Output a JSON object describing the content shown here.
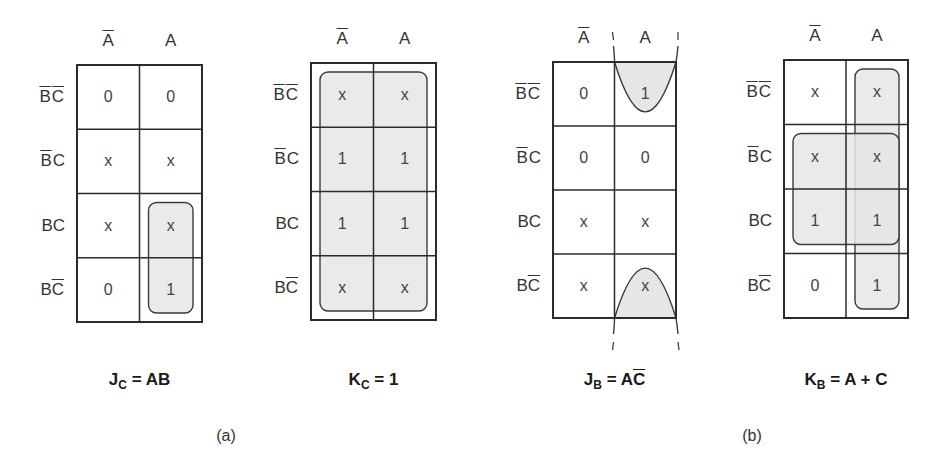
{
  "figure": {
    "panels": [
      {
        "id": "a",
        "label": "(a)",
        "x": 226,
        "y": 427
      },
      {
        "id": "b",
        "label": "(b)",
        "x": 752,
        "y": 427
      }
    ],
    "row_headers": [
      {
        "parts": [
          {
            "t": "B",
            "bar": true
          },
          {
            "t": "C",
            "bar": true
          }
        ]
      },
      {
        "parts": [
          {
            "t": "B",
            "bar": true
          },
          {
            "t": "C",
            "bar": false
          }
        ]
      },
      {
        "parts": [
          {
            "t": "B",
            "bar": false
          },
          {
            "t": "C",
            "bar": false
          }
        ]
      },
      {
        "parts": [
          {
            "t": "B",
            "bar": false
          },
          {
            "t": "C",
            "bar": true
          }
        ]
      }
    ],
    "col_headers": [
      {
        "t": "A",
        "bar": true
      },
      {
        "t": "A",
        "bar": false
      }
    ],
    "maps": [
      {
        "name": "kmap-jc",
        "x0": 77,
        "x1": 202,
        "y0": 65,
        "y1": 322,
        "cells": [
          [
            "0",
            "0"
          ],
          [
            "x",
            "x"
          ],
          [
            "x",
            "x"
          ],
          [
            "0",
            "1"
          ]
        ],
        "equation": {
          "lhs": "J",
          "sub": "C",
          "rhs": [
            {
              "t": "AB",
              "bar": false
            }
          ]
        },
        "eq_y": 370
      },
      {
        "name": "kmap-kc",
        "x0": 311,
        "x1": 436,
        "y0": 63,
        "y1": 320,
        "cells": [
          [
            "x",
            "x"
          ],
          [
            "1",
            "1"
          ],
          [
            "1",
            "1"
          ],
          [
            "x",
            "x"
          ]
        ],
        "equation": {
          "lhs": "K",
          "sub": "C",
          "rhs": [
            {
              "t": "1",
              "bar": false
            }
          ]
        },
        "eq_y": 370
      },
      {
        "name": "kmap-jb",
        "x0": 553,
        "x1": 676,
        "y0": 62,
        "y1": 318,
        "cells": [
          [
            "0",
            "1"
          ],
          [
            "0",
            "0"
          ],
          [
            "x",
            "x"
          ],
          [
            "x",
            "x"
          ]
        ],
        "equation": {
          "lhs": "J",
          "sub": "B",
          "rhs": [
            {
              "t": "A",
              "bar": false
            },
            {
              "t": "C",
              "bar": true
            }
          ]
        },
        "eq_y": 370
      },
      {
        "name": "kmap-kb",
        "x0": 784,
        "x1": 908,
        "y0": 60,
        "y1": 318,
        "cells": [
          [
            "x",
            "x"
          ],
          [
            "x",
            "x"
          ],
          [
            "1",
            "1"
          ],
          [
            "0",
            "1"
          ]
        ],
        "equation": {
          "lhs": "K",
          "sub": "B",
          "rhs": [
            {
              "t": "A + C",
              "bar": false
            }
          ]
        },
        "eq_y": 370
      }
    ],
    "groupings": [
      {
        "map": 0,
        "shape": "rounded-rect",
        "col0": 1,
        "col1": 1,
        "row0": 2,
        "row1": 3
      },
      {
        "map": 1,
        "shape": "rounded-rect",
        "col0": 0,
        "col1": 1,
        "row0": 0,
        "row1": 3
      },
      {
        "map": 2,
        "shape": "wraparound-parabolas",
        "col0": 1,
        "col1": 1,
        "row0": 0,
        "row1": 3
      },
      {
        "map": 3,
        "shape": "rounded-rect",
        "col0": 1,
        "col1": 1,
        "row0": 0,
        "row1": 3
      },
      {
        "map": 3,
        "shape": "rounded-rect",
        "col0": 0,
        "col1": 1,
        "row0": 1,
        "row1": 2
      }
    ],
    "colors": {
      "grid": "#2b2b2b",
      "group_fill": "#e6e6e6",
      "group_stroke": "#3a3a3a"
    }
  }
}
